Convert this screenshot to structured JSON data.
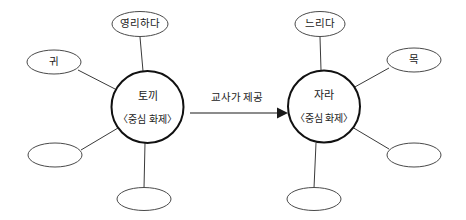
{
  "diagram": {
    "type": "concept-map-pair",
    "title": "",
    "clusters": [
      {
        "id": "rabbit-cluster",
        "core": {
          "label": "토끼",
          "sublabel": "〈중심 화제〉",
          "cx": 147.5,
          "cy": 107,
          "r": 36
        },
        "satellites": [
          {
            "id": "clever",
            "label": "영리하다",
            "cx": 140,
            "cy": 24,
            "rx": 28,
            "ry": 12.5,
            "edge_from": [
              143,
              71
            ],
            "edge_to": [
              140,
              37
            ]
          },
          {
            "id": "ear",
            "label": "귀",
            "cx": 54,
            "cy": 62,
            "rx": 27,
            "ry": 12,
            "edge_from": [
              117,
              90
            ],
            "edge_to": [
              78,
              70
            ]
          },
          {
            "id": "blank-left",
            "label": "",
            "cx": 55,
            "cy": 155,
            "rx": 27,
            "ry": 12,
            "edge_from": [
              118,
              128
            ],
            "edge_to": [
              81,
              150
            ]
          },
          {
            "id": "blank-bottom",
            "label": "",
            "cx": 144,
            "cy": 199,
            "rx": 27,
            "ry": 11.5,
            "edge_from": [
              145,
              143
            ],
            "edge_to": [
              144,
              188
            ]
          }
        ]
      },
      {
        "id": "terrapin-cluster",
        "core": {
          "label": "자라",
          "sublabel": "〈중심 화제〉",
          "cx": 324,
          "cy": 106.5,
          "r": 36
        },
        "satellites": [
          {
            "id": "slow",
            "label": "느리다",
            "cx": 320,
            "cy": 24,
            "rx": 25,
            "ry": 12.5,
            "edge_from": [
              321,
              70
            ],
            "edge_to": [
              320,
              37
            ]
          },
          {
            "id": "neck",
            "label": "목",
            "cx": 414,
            "cy": 60,
            "rx": 27,
            "ry": 12,
            "edge_from": [
              353,
              88
            ],
            "edge_to": [
              389,
              68
            ]
          },
          {
            "id": "blank-right",
            "label": "",
            "cx": 414,
            "cy": 155,
            "rx": 27,
            "ry": 12,
            "edge_from": [
              352,
              127
            ],
            "edge_to": [
              389,
              149
            ]
          },
          {
            "id": "blank-bottom2",
            "label": "",
            "cx": 314,
            "cy": 199,
            "rx": 27,
            "ry": 11.5,
            "edge_from": [
              316,
              143
            ],
            "edge_to": [
              314,
              188
            ]
          }
        ]
      }
    ],
    "connector": {
      "label": "교사가 제공",
      "label_x": 237,
      "label_y": 101,
      "line_x1": 190,
      "line_x2": 277,
      "line_y": 113,
      "head_x": 287
    }
  },
  "colors": {
    "background": "#ffffff",
    "core_stroke": "#111111",
    "satellite_stroke": "#4a4a4a",
    "edge_stroke": "#3a3a3a",
    "text": "#1a1a1a"
  }
}
